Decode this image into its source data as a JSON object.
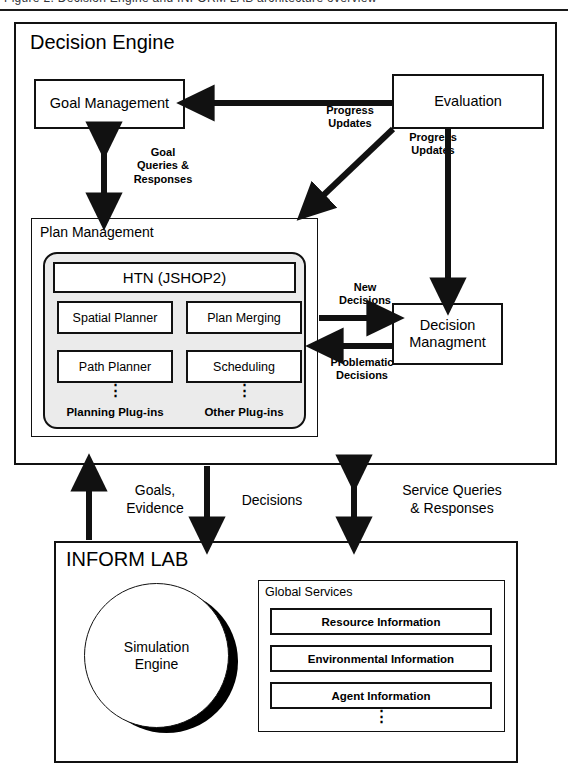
{
  "page": {
    "cut_off_header": "Figure 2. Decision Engine and INFORM LAB architecture overview"
  },
  "decision_engine": {
    "title": "Decision Engine",
    "goal_management": {
      "label": "Goal Management"
    },
    "evaluation": {
      "label": "Evaluation"
    },
    "decision_management": {
      "label": "Decision\nManagment"
    },
    "plan_management": {
      "title": "Plan Management",
      "htn": "HTN (JSHOP2)",
      "planning_plugins": {
        "caption": "Planning Plug-ins",
        "items": [
          "Spatial Planner",
          "Path Planner"
        ],
        "ellipsis": "⋮"
      },
      "other_plugins": {
        "caption": "Other Plug-ins",
        "items": [
          "Plan Merging",
          "Scheduling"
        ],
        "ellipsis": "⋮"
      }
    },
    "edges": {
      "eval_to_goal": "Progress\nUpdates",
      "eval_to_plan": "Progress\nUpdates",
      "goal_plan_bidir": "Goal\nQueries &\nResponses",
      "plan_to_decision": "New\nDecisions",
      "decision_to_plan": "Problematic\nDecisions"
    }
  },
  "bridge_edges": {
    "goals_evidence": "Goals,\nEvidence",
    "decisions": "Decisions",
    "service_queries": "Service Queries\n& Responses"
  },
  "inform_lab": {
    "title": "INFORM LAB",
    "simulation_engine": {
      "label": "Simulation\nEngine"
    },
    "global_services": {
      "title": "Global Services",
      "services": [
        "Resource Information",
        "Environmental Information",
        "Agent Information"
      ],
      "ellipsis": "⋮"
    }
  },
  "colors": {
    "stroke": "#111111",
    "plugin_shell_fill": "#ebebeb",
    "canvas": "#ffffff"
  }
}
